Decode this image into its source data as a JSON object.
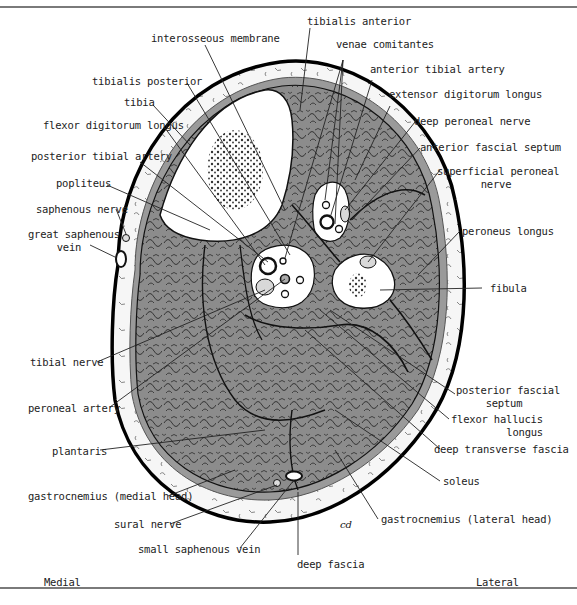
{
  "diagram": {
    "type": "anatomical cross-section",
    "orientation": {
      "left": "Medial",
      "right": "Lateral"
    },
    "colors": {
      "skin_outline": "#000000",
      "subcutaneous_fat": "#f4f4f4",
      "deep_fascia": "#9a9a9a",
      "muscle": "#8c8c8c",
      "muscle_texture": "#2a2a2a",
      "bone_cortex": "#ffffff",
      "bone_marrow": "#555555",
      "vessel_space": "#ffffff",
      "nerve": "#d8d8d8",
      "rule": "#7a7a7a"
    },
    "signature": "cd"
  },
  "labels": {
    "tibialis_anterior": "tibialis anterior",
    "interosseous_membrane": "interosseous membrane",
    "venae_comitantes": "venae comitantes",
    "anterior_tibial_artery": "anterior tibial artery",
    "tibialis_posterior": "tibialis posterior",
    "extensor_digitorum_longus": "extensor digitorum longus",
    "tibia": "tibia",
    "deep_peroneal_nerve": "deep peroneal nerve",
    "flexor_digitorum_longus": "flexor digitorum longus",
    "anterior_fascial_septum": "anterior fascial septum",
    "posterior_tibial_artery": "posterior tibial artery",
    "superficial_peroneal_nerve_1": "superficial peroneal",
    "superficial_peroneal_nerve_2": "nerve",
    "popliteus": "popliteus",
    "saphenous_nerve": "saphenous nerve",
    "great_saphenous_vein_1": "great saphenous",
    "great_saphenous_vein_2": "vein",
    "peroneus_longus": "peroneus longus",
    "fibula": "fibula",
    "tibial_nerve": "tibial nerve",
    "posterior_fascial_septum_1": "posterior fascial",
    "posterior_fascial_septum_2": "septum",
    "peroneal_artery": "peroneal artery",
    "flexor_hallucis_longus_1": "flexor hallucis",
    "flexor_hallucis_longus_2": "longus",
    "deep_transverse_fascia": "deep transverse fascia",
    "plantaris": "plantaris",
    "soleus": "soleus",
    "gastrocnemius_medial": "gastrocnemius (medial head)",
    "sural_nerve": "sural nerve",
    "gastrocnemius_lateral": "gastrocnemius (lateral head)",
    "small_saphenous_vein": "small saphenous vein",
    "deep_fascia": "deep fascia",
    "medial": "Medial",
    "lateral": "Lateral"
  }
}
